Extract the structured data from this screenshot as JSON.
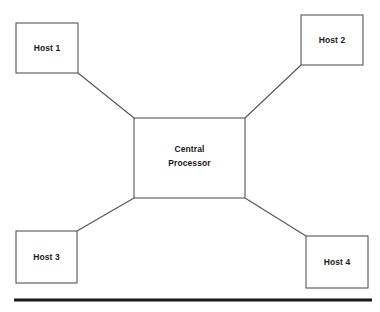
{
  "diagram": {
    "type": "star-topology-network-diagram",
    "center": {
      "label_line1": "Central",
      "label_line2": "Processor",
      "box": {
        "x": 134,
        "y": 118,
        "w": 111,
        "h": 80
      }
    },
    "hosts": [
      {
        "id": "host-1",
        "label": "Host 1",
        "box": {
          "x": 16,
          "y": 23,
          "w": 62,
          "h": 50
        },
        "link": {
          "x1": 78,
          "y1": 73,
          "x2": 134,
          "y2": 118
        }
      },
      {
        "id": "host-2",
        "label": "Host 2",
        "box": {
          "x": 301,
          "y": 15,
          "w": 62,
          "h": 50
        },
        "link": {
          "x1": 301,
          "y1": 65,
          "x2": 245,
          "y2": 118
        }
      },
      {
        "id": "host-3",
        "label": "Host 3",
        "box": {
          "x": 16,
          "y": 231,
          "w": 61,
          "h": 52
        },
        "link": {
          "x1": 77,
          "y1": 231,
          "x2": 134,
          "y2": 198
        }
      },
      {
        "id": "host-4",
        "label": "Host 4",
        "box": {
          "x": 306,
          "y": 236,
          "w": 62,
          "h": 52
        },
        "link": {
          "x1": 306,
          "y1": 236,
          "x2": 245,
          "y2": 198
        }
      }
    ],
    "footer_rule": {
      "x1": 14,
      "y1": 300,
      "x2": 372,
      "y2": 300
    },
    "colors": {
      "background": "#ffffff",
      "box_stroke": "#555555",
      "link_stroke": "#555555",
      "text": "#1a1a1a",
      "rule": "#1a1a1a"
    }
  }
}
